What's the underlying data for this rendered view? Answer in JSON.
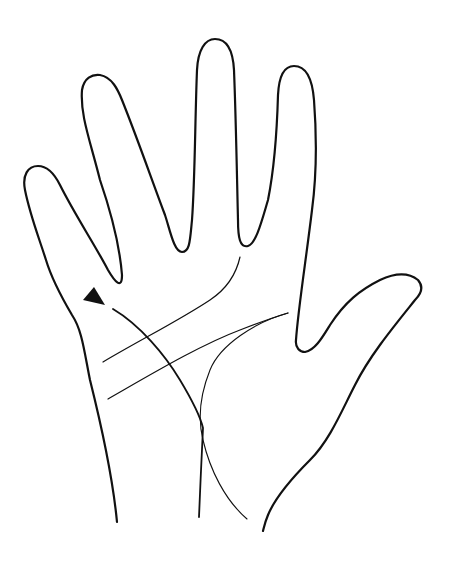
{
  "diagram": {
    "background": "#ffffff",
    "stroke_color": "#111111",
    "outline": {
      "name": "hand-outline",
      "stroke_width": 2.2,
      "path": "M117,522 C112,470 100,420 90,380 C84,350 82,330 72,315 C62,298 52,280 46,260 C38,235 30,215 25,190 C22,175 28,166 38,166 C48,166 55,175 60,185 C75,215 95,245 108,270 C115,282 122,290 122,275 C120,250 112,215 100,180 C90,140 80,115 82,90 C84,78 92,74 100,75 C112,77 118,90 122,100 C138,140 150,175 165,215 C170,230 174,252 182,252 C190,252 190,240 192,220 C195,180 195,120 197,70 C198,50 205,39 215,39 C228,39 233,52 234,70 C236,120 237,180 238,220 C238,238 240,248 248,246 C256,244 262,220 268,200 C274,170 277,130 278,95 C279,75 285,66 294,66 C305,66 312,75 314,100 C317,140 316,180 312,210 C306,260 298,310 296,340 C295,348 300,352 305,352 C315,350 322,338 330,325 C345,302 360,290 380,280 C395,273 408,272 418,280 C424,287 421,294 415,300 C395,325 370,355 355,385 C342,410 330,440 310,460 C290,480 275,498 268,515 C265,522 264,527 263,531"
    },
    "lines": [
      {
        "name": "heart-line",
        "path": "M103,362 C140,340 180,320 210,300 C225,290 236,275 240,257",
        "stroke_width": 1.2
      },
      {
        "name": "head-line",
        "path": "M108,399 C150,375 200,345 240,330 C260,322 275,317 288,313",
        "stroke_width": 1.2
      },
      {
        "name": "life-line",
        "path": "M113,309 C140,325 165,355 180,380 C192,400 200,415 203,428 C202,450 200,490 199,517",
        "stroke_width": 1.8
      },
      {
        "name": "fate-line",
        "path": "M288,313 C255,322 220,345 210,370 C200,395 198,420 203,440 C210,470 225,500 247,519",
        "stroke_width": 1.1
      }
    ],
    "marker": {
      "name": "arrow-marker",
      "points": "83,300 94,287 105,305",
      "fill": "#111111"
    }
  }
}
